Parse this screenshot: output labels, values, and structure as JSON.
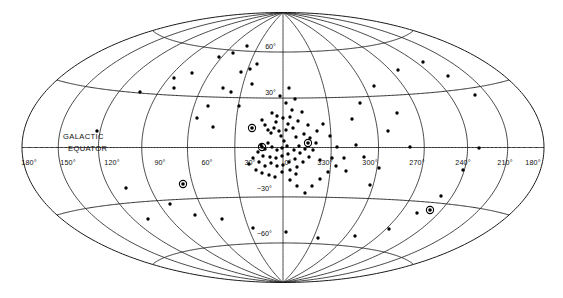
{
  "figure": {
    "projection": "hammer-aitoff",
    "coordinate_system": "galactic",
    "equator_label_line1": "GALACTIC",
    "equator_label_line2": "EQUATOR",
    "ink_color": "#111111",
    "marker_color": "#000000",
    "background_color": "#ffffff"
  },
  "chart_data": {
    "type": "scatter",
    "title": "",
    "subtitle": "",
    "xlabel": "",
    "ylabel": "",
    "projection": "hammer-aitoff",
    "grid": true,
    "legend": "none",
    "xlim": [
      180,
      -180
    ],
    "ylim": [
      -90,
      90
    ],
    "annotations": [
      "GALACTIC",
      "EQUATOR"
    ],
    "longitude_ticks": [
      {
        "label": "180°",
        "value": 180,
        "x": 29,
        "y": 165
      },
      {
        "label": "150°",
        "value": 150,
        "x": 68,
        "y": 165
      },
      {
        "label": "120°",
        "value": 120,
        "x": 112,
        "y": 165
      },
      {
        "label": "90°",
        "value": 90,
        "x": 160,
        "y": 165
      },
      {
        "label": "60°",
        "value": 60,
        "x": 207,
        "y": 165
      },
      {
        "label": "30°",
        "value": 30,
        "x": 250,
        "y": 165
      },
      {
        "label": "0°",
        "value": 0,
        "x": 288,
        "y": 165
      },
      {
        "label": "330°",
        "value": 330,
        "x": 325,
        "y": 165
      },
      {
        "label": "300°",
        "value": 300,
        "x": 370,
        "y": 165
      },
      {
        "label": "270°",
        "value": 270,
        "x": 417,
        "y": 165
      },
      {
        "label": "240°",
        "value": 240,
        "x": 463,
        "y": 165
      },
      {
        "label": "210°",
        "value": 210,
        "x": 505,
        "y": 165
      },
      {
        "label": "180°",
        "value": 180,
        "x": 533,
        "y": 165
      }
    ],
    "latitude_ticks": [
      {
        "label": "60°",
        "value": 60,
        "x": 276,
        "y": 49
      },
      {
        "label": "30°",
        "value": 30,
        "x": 276,
        "y": 95
      },
      {
        "label": "−30°",
        "value": -30,
        "x": 272,
        "y": 191
      },
      {
        "label": "−60°",
        "value": -60,
        "x": 272,
        "y": 236
      }
    ],
    "meridians_deg": [
      180,
      150,
      120,
      90,
      60,
      30,
      0,
      -30,
      -60,
      -90,
      -120,
      -150,
      -180
    ],
    "parallels_deg": [
      60,
      30,
      0,
      -30,
      -60
    ],
    "marker_types": [
      "dot",
      "circled-dot"
    ],
    "point_count": 126,
    "circled_point_count": 5,
    "points": [
      [
        97,
        131
      ],
      [
        140,
        92
      ],
      [
        174,
        78
      ],
      [
        174,
        88
      ],
      [
        192,
        73
      ],
      [
        197,
        118
      ],
      [
        213,
        127
      ],
      [
        208,
        106
      ],
      [
        219,
        57
      ],
      [
        233,
        53
      ],
      [
        247,
        46
      ],
      [
        223,
        88
      ],
      [
        231,
        92
      ],
      [
        239,
        106
      ],
      [
        241,
        72
      ],
      [
        250,
        69
      ],
      [
        252,
        84
      ],
      [
        257,
        64
      ],
      [
        262,
        120
      ],
      [
        265,
        125
      ],
      [
        268,
        130
      ],
      [
        271,
        133
      ],
      [
        274,
        128
      ],
      [
        276,
        122
      ],
      [
        279,
        131
      ],
      [
        281,
        136
      ],
      [
        284,
        141
      ],
      [
        286,
        130
      ],
      [
        288,
        124
      ],
      [
        283,
        118
      ],
      [
        277,
        116
      ],
      [
        272,
        113
      ],
      [
        290,
        117
      ],
      [
        293,
        128
      ],
      [
        296,
        137
      ],
      [
        287,
        146
      ],
      [
        282,
        148
      ],
      [
        277,
        150
      ],
      [
        272,
        147
      ],
      [
        268,
        143
      ],
      [
        265,
        149
      ],
      [
        261,
        145
      ],
      [
        258,
        152
      ],
      [
        263,
        156
      ],
      [
        270,
        157
      ],
      [
        276,
        158
      ],
      [
        282,
        156
      ],
      [
        288,
        154
      ],
      [
        294,
        150
      ],
      [
        299,
        146
      ],
      [
        300,
        153
      ],
      [
        305,
        149
      ],
      [
        295,
        159
      ],
      [
        289,
        162
      ],
      [
        283,
        165
      ],
      [
        277,
        166
      ],
      [
        271,
        163
      ],
      [
        265,
        166
      ],
      [
        259,
        162
      ],
      [
        253,
        158
      ],
      [
        249,
        164
      ],
      [
        256,
        170
      ],
      [
        262,
        173
      ],
      [
        269,
        175
      ],
      [
        275,
        177
      ],
      [
        282,
        172
      ],
      [
        290,
        170
      ],
      [
        297,
        167
      ],
      [
        303,
        162
      ],
      [
        309,
        157
      ],
      [
        313,
        150
      ],
      [
        316,
        143
      ],
      [
        310,
        138
      ],
      [
        304,
        134
      ],
      [
        298,
        121
      ],
      [
        292,
        110
      ],
      [
        286,
        103
      ],
      [
        280,
        96
      ],
      [
        289,
        88
      ],
      [
        295,
        99
      ],
      [
        302,
        112
      ],
      [
        308,
        125
      ],
      [
        317,
        131
      ],
      [
        323,
        124
      ],
      [
        330,
        136
      ],
      [
        337,
        147
      ],
      [
        344,
        158
      ],
      [
        336,
        166
      ],
      [
        328,
        172
      ],
      [
        320,
        179
      ],
      [
        312,
        186
      ],
      [
        305,
        193
      ],
      [
        297,
        186
      ],
      [
        290,
        180
      ],
      [
        296,
        174
      ],
      [
        320,
        160
      ],
      [
        332,
        158
      ],
      [
        346,
        171
      ],
      [
        356,
        145
      ],
      [
        364,
        157
      ],
      [
        370,
        185
      ],
      [
        379,
        168
      ],
      [
        388,
        131
      ],
      [
        397,
        113
      ],
      [
        410,
        147
      ],
      [
        352,
        119
      ],
      [
        360,
        103
      ],
      [
        374,
        86
      ],
      [
        398,
        70
      ],
      [
        423,
        62
      ],
      [
        448,
        76
      ],
      [
        475,
        95
      ],
      [
        479,
        148
      ],
      [
        463,
        170
      ],
      [
        441,
        196
      ],
      [
        417,
        213
      ],
      [
        389,
        229
      ],
      [
        355,
        236
      ],
      [
        318,
        238
      ],
      [
        286,
        232
      ],
      [
        253,
        228
      ],
      [
        222,
        219
      ],
      [
        195,
        215
      ],
      [
        170,
        204
      ],
      [
        148,
        219
      ],
      [
        126,
        188
      ]
    ],
    "circled_points": [
      [
        183,
        184
      ],
      [
        252,
        128
      ],
      [
        262,
        147
      ],
      [
        308,
        143
      ],
      [
        430,
        210
      ]
    ]
  }
}
